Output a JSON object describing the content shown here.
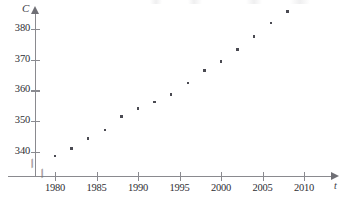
{
  "chart_data": {
    "type": "scatter",
    "title": "",
    "xlabel": "t",
    "ylabel": "C",
    "xlim": [
      1978.5,
      2011
    ],
    "ylim": [
      336.5,
      386
    ],
    "grid": false,
    "legend": null,
    "axis_break_x": true,
    "axis_break_y": true,
    "x_ticks": [
      1980,
      1985,
      1990,
      1995,
      2000,
      2005,
      2010
    ],
    "y_ticks": [
      340,
      350,
      360,
      370,
      380
    ],
    "series": [
      {
        "name": "CO2 concentration",
        "x": [
          1980,
          1982,
          1984,
          1986,
          1988,
          1990,
          1992,
          1994,
          1996,
          1998,
          2000,
          2002,
          2004,
          2006,
          2008
        ],
        "values": [
          338.7,
          341.2,
          344.4,
          347.2,
          351.5,
          354.2,
          356.3,
          358.6,
          362.4,
          366.5,
          369.4,
          373.2,
          377.5,
          381.9,
          385.6
        ]
      }
    ]
  },
  "axes": {
    "y_name": "C",
    "x_name": "t",
    "x_tick_labels": [
      "1980",
      "1985",
      "1990",
      "1995",
      "2000",
      "2005",
      "2010"
    ],
    "y_tick_labels": [
      "340",
      "350",
      "360",
      "370",
      "380"
    ],
    "break_glyph": "//"
  },
  "colors": {
    "axis": "#8a8a8f",
    "point": "#4a4a52",
    "text": "#2e2e33",
    "background": "#ffffff"
  }
}
